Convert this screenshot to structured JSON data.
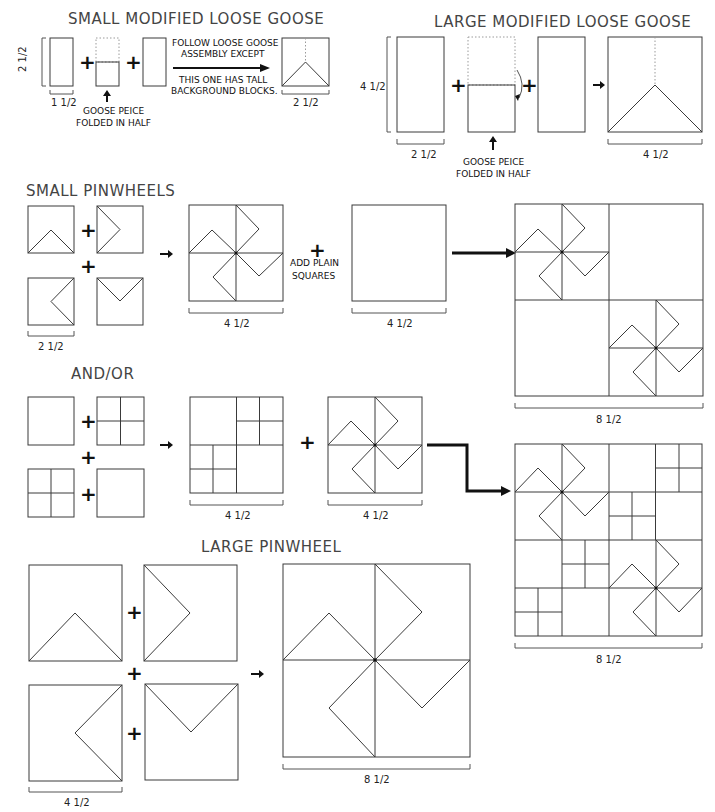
{
  "sections": {
    "small_goose": {
      "title": "SMALL MODIFIED LOOSE GOOSE",
      "height_label": "2 1/2",
      "width_label": "1 1/2",
      "goose_note_line1": "GOOSE PEICE",
      "goose_note_line2": "FOLDED IN HALF",
      "instruction_line1": "FOLLOW LOOSE GOOSE",
      "instruction_line2": "ASSEMBLY EXCEPT",
      "instruction_line3": "THIS ONE HAS TALL",
      "instruction_line4": "BACKGROUND BLOCKS.",
      "result_label": "2 1/2"
    },
    "large_goose": {
      "title": "LARGE MODIFIED LOOSE GOOSE",
      "height_label": "4 1/2",
      "width_label": "2 1/2",
      "goose_note_line1": "GOOSE PEICE",
      "goose_note_line2": "FOLDED IN HALF",
      "result_label": "4 1/2"
    },
    "small_pinwheels": {
      "title": "SMALL PINWHEELS",
      "unit_label": "2 1/2",
      "result_label": "4 1/2",
      "add_note_line1": "ADD PLAIN",
      "add_note_line2": "SQUARES",
      "plain_label": "4 1/2",
      "assembled_label": "8 1/2"
    },
    "and_or": {
      "title": "AND/OR",
      "fourpatch_label": "4 1/2",
      "pinwheel_label": "4 1/2",
      "assembled_label": "8 1/2"
    },
    "large_pinwheel": {
      "title": "LARGE PINWHEEL",
      "unit_label": "4 1/2",
      "result_label": "8 1/2"
    }
  },
  "symbols": {
    "plus": "+"
  }
}
